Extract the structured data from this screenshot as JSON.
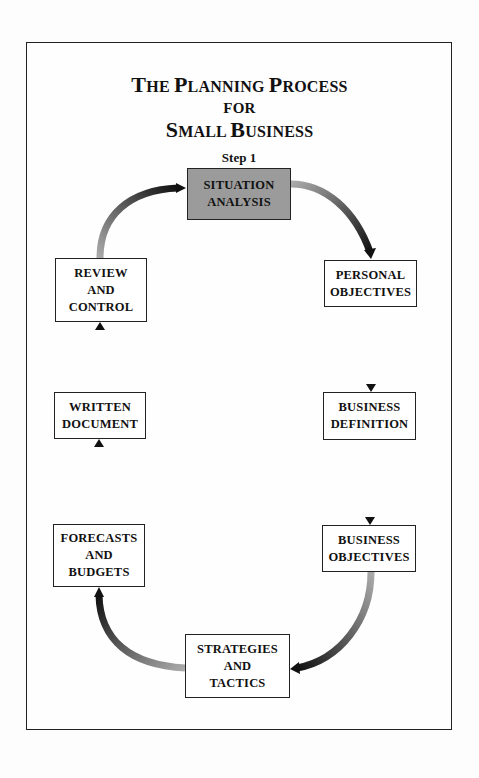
{
  "title": {
    "line1": {
      "cap1": "T",
      "rest1": "HE ",
      "cap2": "P",
      "rest2": "LANNING ",
      "cap3": "P",
      "rest3": "ROCESS"
    },
    "line2": "FOR",
    "line3": {
      "cap1": "S",
      "rest1": "MALL ",
      "cap2": "B",
      "rest2": "USINESS"
    },
    "full_text": "The Planning Process for Small Business"
  },
  "step_label": "Step 1",
  "steps": [
    {
      "id": "situation-analysis",
      "lines": [
        "SITUATION",
        "ANALYSIS"
      ],
      "highlighted": true
    },
    {
      "id": "personal-objectives",
      "lines": [
        "PERSONAL",
        "OBJECTIVES"
      ]
    },
    {
      "id": "business-definition",
      "lines": [
        "BUSINESS",
        "DEFINITION"
      ]
    },
    {
      "id": "business-objectives",
      "lines": [
        "BUSINESS",
        "OBJECTIVES"
      ]
    },
    {
      "id": "strategies-and-tactics",
      "lines": [
        "STRATEGIES",
        "AND",
        "TACTICS"
      ]
    },
    {
      "id": "forecasts-and-budgets",
      "lines": [
        "FORECASTS",
        "AND",
        "BUDGETS"
      ]
    },
    {
      "id": "written-document",
      "lines": [
        "WRITTEN",
        "DOCUMENT"
      ]
    },
    {
      "id": "review-and-control",
      "lines": [
        "REVIEW",
        "AND",
        "CONTROL"
      ]
    }
  ],
  "colors": {
    "highlight_fill": "#9b9b9b",
    "border": "#222222",
    "arrow_dark": "#111111",
    "arrow_light": "#aaaaaa"
  }
}
